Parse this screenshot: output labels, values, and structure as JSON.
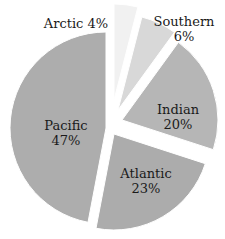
{
  "chart_data": {
    "type": "pie",
    "title": "",
    "exploded": true,
    "categories": [
      "Arctic",
      "Southern",
      "Indian",
      "Atlantic",
      "Pacific"
    ],
    "values": [
      4,
      6,
      20,
      23,
      47
    ],
    "unit": "%",
    "start_angle_deg": 0,
    "direction": "clockwise",
    "colors": [
      "#f1f1f1",
      "#d8d8d8",
      "#b6b6b6",
      "#acacac",
      "#adadad"
    ],
    "labels": [
      {
        "name": "Arctic",
        "percent": "4%",
        "position": "outside-left",
        "layout": "inline"
      },
      {
        "name": "Southern",
        "percent": "6%",
        "position": "outside-right",
        "layout": "stacked"
      },
      {
        "name": "Indian",
        "percent": "20%",
        "position": "inside",
        "layout": "stacked"
      },
      {
        "name": "Atlantic",
        "percent": "23%",
        "position": "inside",
        "layout": "stacked"
      },
      {
        "name": "Pacific",
        "percent": "47%",
        "position": "inside",
        "layout": "stacked"
      }
    ],
    "legend": "none"
  },
  "geometry": {
    "center": [
      112,
      126
    ],
    "radius": 96,
    "offsets": [
      [
        2,
        -26
      ],
      [
        6,
        -16
      ],
      [
        10,
        -6
      ],
      [
        2,
        8
      ],
      [
        -6,
        2
      ]
    ],
    "label_positions": [
      [
        76,
        23
      ],
      [
        184,
        29
      ],
      [
        178,
        117
      ],
      [
        146,
        181
      ],
      [
        66,
        133
      ]
    ]
  }
}
